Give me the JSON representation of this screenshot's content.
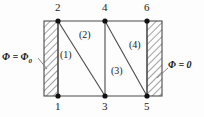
{
  "figure": {
    "kind": "finite-element-mesh-diagram",
    "background_color": "#fdfdfd",
    "line_color": "#3a3a3a",
    "node_color": "#111111"
  },
  "boundary_conditions": {
    "left": {
      "name": "left-boundary-condition",
      "symbol": "Φ",
      "equals": " = ",
      "value": "Φ",
      "subscript": "0",
      "full_text": "Φ = Φ₀"
    },
    "right": {
      "name": "right-boundary-condition",
      "symbol": "Φ",
      "equals": " = ",
      "value": "0",
      "full_text": "Φ = 0"
    }
  },
  "nodes": [
    {
      "id": "1",
      "label": "1",
      "x": 58,
      "y": 96,
      "label_x": 55,
      "label_y": 100
    },
    {
      "id": "2",
      "label": "2",
      "x": 58,
      "y": 21,
      "label_x": 55,
      "label_y": 2
    },
    {
      "id": "3",
      "label": "3",
      "x": 105,
      "y": 96,
      "label_x": 102,
      "label_y": 100
    },
    {
      "id": "4",
      "label": "4",
      "x": 105,
      "y": 21,
      "label_x": 102,
      "label_y": 2
    },
    {
      "id": "5",
      "label": "5",
      "x": 147,
      "y": 96,
      "label_x": 144,
      "label_y": 100
    },
    {
      "id": "6",
      "label": "6",
      "x": 147,
      "y": 21,
      "label_x": 144,
      "label_y": 2
    }
  ],
  "elements": [
    {
      "id": "1",
      "label": "(1)",
      "nodes": [
        "1",
        "2",
        "3"
      ],
      "label_x": 60,
      "label_y": 50
    },
    {
      "id": "2",
      "label": "(2)",
      "nodes": [
        "2",
        "3",
        "4"
      ],
      "label_x": 79,
      "label_y": 30
    },
    {
      "id": "3",
      "label": "(3)",
      "nodes": [
        "3",
        "4",
        "5"
      ],
      "label_x": 111,
      "label_y": 66
    },
    {
      "id": "4",
      "label": "(4)",
      "nodes": [
        "4",
        "5",
        "6"
      ],
      "label_x": 129,
      "label_y": 40
    }
  ],
  "mesh_edges": [
    {
      "name": "edge-2-6-top",
      "from": "2",
      "to": "6"
    },
    {
      "name": "edge-1-5-bottom",
      "from": "1",
      "to": "5"
    },
    {
      "name": "edge-1-2-left",
      "from": "1",
      "to": "2"
    },
    {
      "name": "edge-3-4-middle",
      "from": "3",
      "to": "4"
    },
    {
      "name": "edge-5-6-right",
      "from": "5",
      "to": "6"
    },
    {
      "name": "diagonal-2-3",
      "from": "2",
      "to": "3"
    },
    {
      "name": "diagonal-4-5",
      "from": "4",
      "to": "5"
    }
  ],
  "hatched_blocks": [
    {
      "name": "left-hatched-block",
      "x": 44,
      "y": 21,
      "width": 14,
      "height": 75
    },
    {
      "name": "right-hatched-block",
      "x": 147,
      "y": 21,
      "width": 15,
      "height": 75
    }
  ],
  "leader_lines": [
    {
      "name": "left-leader-line",
      "x1": 38,
      "y1": 58,
      "x2": 47,
      "y2": 69
    },
    {
      "name": "right-leader-line",
      "x1": 157,
      "y1": 78,
      "x2": 168,
      "y2": 68
    }
  ]
}
